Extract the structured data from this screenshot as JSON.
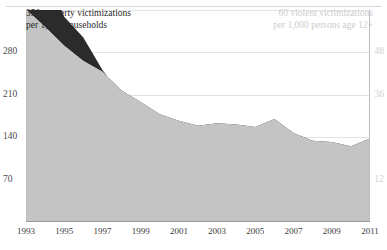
{
  "figure": {
    "clipped_heading": "",
    "background": "#ffffff"
  },
  "captions": {
    "left_line1": "350 property victimizations",
    "left_line2": "per 1,000 households",
    "right_line1": "60 violent victimizations",
    "right_line2": "per 1,000 persons age 12+"
  },
  "colors": {
    "property_area": "#c4c4c4",
    "violent_band": "#2b2b2b",
    "grid": "#e2e2e2",
    "axis": "#9a9a9a",
    "left_tick_text": "#4a4a4a",
    "right_tick_text": "#cfcfcf"
  },
  "chart_data": {
    "type": "area",
    "title": "",
    "subtitle": "",
    "xlabel": "",
    "ylabel": "property victimizations per 1,000 households",
    "y2label": "violent victimizations per 1,000 persons age 12+",
    "grid": true,
    "legend": "inline-labels",
    "x": [
      1993,
      1994,
      1995,
      1996,
      1997,
      1998,
      1999,
      2000,
      2001,
      2002,
      2003,
      2004,
      2005,
      2006,
      2007,
      2008,
      2009,
      2010,
      2011
    ],
    "xlim": [
      1993,
      2011
    ],
    "xticks": [
      1993,
      1995,
      1997,
      1999,
      2001,
      2003,
      2005,
      2007,
      2009,
      2011
    ],
    "xticklabels": [
      "1993",
      "1995",
      "1997",
      "1999",
      "2001",
      "2003",
      "2005",
      "2007",
      "2009",
      "2011"
    ],
    "ylim": [
      0,
      350
    ],
    "yticks": [
      70,
      140,
      210,
      280,
      350
    ],
    "yticklabels": [
      "70",
      "140",
      "210",
      "280",
      "350"
    ],
    "y2lim": [
      0,
      60
    ],
    "y2ticks": [
      12,
      24,
      36,
      48,
      60
    ],
    "y2ticklabels": [
      "12",
      "24",
      "36",
      "48",
      "60"
    ],
    "y2ticks_visible": [
      12,
      36,
      48
    ],
    "series": [
      {
        "name": "property victimizations per 1,000 households",
        "axis": "left",
        "color": "#c4c4c4",
        "values": [
          351,
          322,
          291,
          266,
          248,
          217,
          198,
          178,
          167,
          159,
          163,
          161,
          157,
          170,
          147,
          134,
          132,
          125,
          138
        ]
      },
      {
        "name": "violent victimizations per 1,000 persons age 12+",
        "axis": "right",
        "color": "#2b2b2b",
        "values": [
          79.8,
          71.9,
          58.1,
          52.2,
          43.0,
          36.0,
          32.1,
          27.4,
          24.7,
          23.1,
          22.3,
          21.1,
          21.2,
          25.0,
          20.7,
          19.3,
          17.1,
          19.3,
          22.5
        ]
      }
    ]
  }
}
